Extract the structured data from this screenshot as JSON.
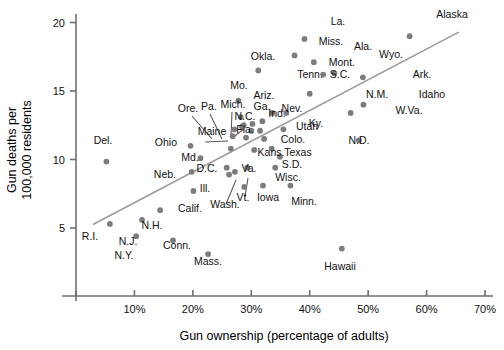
{
  "chart_data": {
    "type": "scatter",
    "title": "",
    "xlabel": "Gun ownership (percentage of adults)",
    "ylabel": "Gun deaths per 100,000 residents",
    "ylabel_line1": "Gun deaths per",
    "ylabel_line2": "100,000 residents",
    "xlim": [
      0,
      70
    ],
    "ylim": [
      0,
      20
    ],
    "xticks": [
      10,
      20,
      30,
      40,
      50,
      60,
      70
    ],
    "xticklabels": [
      "10%",
      "20%",
      "30%",
      "40%",
      "50%",
      "60%",
      "70%"
    ],
    "yticks": [
      5,
      10,
      15,
      20
    ],
    "yticklabels": [
      "5",
      "10",
      "15",
      "20"
    ],
    "grid": false,
    "legend": null,
    "trendline": {
      "x0": 2.9,
      "y0": 5.25,
      "x1": 65.5,
      "y1": 19.3
    },
    "point_color": "#7c7c7c",
    "line_color": "#9a9a9a",
    "points": [
      {
        "label": "Del.",
        "x": 5.2,
        "y": 9.85,
        "lx": 103,
        "ly": 144,
        "anchor": "middle"
      },
      {
        "label": "R.I.",
        "x": 5.8,
        "y": 5.3,
        "lx": 90,
        "ly": 240,
        "anchor": "middle"
      },
      {
        "label": "N.J.",
        "x": 11.3,
        "y": 5.6,
        "lx": 128,
        "ly": 245,
        "anchor": "middle"
      },
      {
        "label": "N.Y.",
        "x": 10.3,
        "y": 4.4,
        "lx": 124,
        "ly": 259,
        "anchor": "middle"
      },
      {
        "label": "N.H.",
        "x": 14.4,
        "y": 6.3,
        "lx": 152,
        "ly": 229,
        "anchor": "middle"
      },
      {
        "label": "Conn.",
        "x": 16.6,
        "y": 4.1,
        "lx": 177,
        "ly": 249,
        "anchor": "middle"
      },
      {
        "label": "Mass.",
        "x": 22.6,
        "y": 3.1,
        "lx": 208,
        "ly": 265,
        "anchor": "middle"
      },
      {
        "label": "Calif.",
        "x": 20.1,
        "y": 7.7,
        "lx": 190,
        "ly": 212,
        "anchor": "middle"
      },
      {
        "label": "Ohio",
        "x": 19.6,
        "y": 11.0,
        "lx": 177,
        "ly": 146,
        "anchor": "end"
      },
      {
        "label": "Md.",
        "x": 21.3,
        "y": 10.1,
        "lx": 190,
        "ly": 161,
        "anchor": "middle"
      },
      {
        "label": "Neb.",
        "x": 19.8,
        "y": 9.1,
        "lx": 176,
        "ly": 178,
        "anchor": "end"
      },
      {
        "label": "Wash.",
        "x": 27.2,
        "y": 9.1,
        "lx": 225,
        "ly": 208,
        "anchor": "middle"
      },
      {
        "label": "Ill.",
        "x": 26.2,
        "y": 8.9,
        "lx": 205,
        "ly": 192,
        "anchor": "middle"
      },
      {
        "label": "D.C.",
        "x": 25.8,
        "y": 9.4,
        "lx": 207,
        "ly": 172,
        "anchor": "middle"
      },
      {
        "label": "Va.",
        "x": 29.3,
        "y": 9.4,
        "lx": 249,
        "ly": 172,
        "anchor": "middle"
      },
      {
        "label": "Vt.",
        "x": 28.8,
        "y": 8.0,
        "lx": 243,
        "ly": 201,
        "anchor": "middle"
      },
      {
        "label": "Iowa",
        "x": 32.0,
        "y": 8.1,
        "lx": 268,
        "ly": 201,
        "anchor": "middle"
      },
      {
        "label": "Minn.",
        "x": 36.7,
        "y": 8.1,
        "lx": 304,
        "ly": 205,
        "anchor": "middle"
      },
      {
        "label": "Wisc.",
        "x": 34.1,
        "y": 9.4,
        "lx": 288,
        "ly": 181,
        "anchor": "middle"
      },
      {
        "label": "S.D.",
        "x": 34.9,
        "y": 10.2,
        "lx": 292,
        "ly": 168,
        "anchor": "middle"
      },
      {
        "label": "Texas",
        "x": 33.5,
        "y": 10.8,
        "lx": 298,
        "ly": 156,
        "anchor": "middle"
      },
      {
        "label": "Kans.",
        "x": 30.5,
        "y": 10.7,
        "lx": 271,
        "ly": 156,
        "anchor": "middle"
      },
      {
        "label": "Colo.",
        "x": 32.2,
        "y": 11.5,
        "lx": 293,
        "ly": 143,
        "anchor": "middle"
      },
      {
        "label": "Utah",
        "x": 31.5,
        "y": 12.1,
        "lx": 307,
        "ly": 130,
        "anchor": "middle"
      },
      {
        "label": "Maine",
        "x": 26.5,
        "y": 10.8,
        "lx": 212,
        "ly": 135,
        "anchor": "middle"
      },
      {
        "label": "Ore.",
        "x": 26.8,
        "y": 11.7,
        "lx": 188,
        "ly": 112,
        "anchor": "middle"
      },
      {
        "label": "Pa.",
        "x": 27.1,
        "y": 12.2,
        "lx": 209,
        "ly": 110,
        "anchor": "middle"
      },
      {
        "label": "Mich.",
        "x": 28.4,
        "y": 12.4,
        "lx": 233,
        "ly": 108,
        "anchor": "middle"
      },
      {
        "label": "N.C.",
        "x": 28.7,
        "y": 12.5,
        "lx": 245,
        "ly": 120,
        "anchor": "middle"
      },
      {
        "label": "Fla.",
        "x": 29.1,
        "y": 11.6,
        "lx": 245,
        "ly": 133,
        "anchor": "middle"
      },
      {
        "label": "Ga.",
        "x": 30.2,
        "y": 12.6,
        "lx": 262,
        "ly": 110,
        "anchor": "middle"
      },
      {
        "label": "Ind.",
        "x": 30.0,
        "y": 12.1,
        "lx": 277,
        "ly": 117,
        "anchor": "middle"
      },
      {
        "label": "Ariz.",
        "x": 28.2,
        "y": 13.1,
        "lx": 264,
        "ly": 99,
        "anchor": "middle"
      },
      {
        "label": "Nev.",
        "x": 31.9,
        "y": 12.8,
        "lx": 292,
        "ly": 112,
        "anchor": "middle"
      },
      {
        "label": "Mo.",
        "x": 27.8,
        "y": 14.3,
        "lx": 239,
        "ly": 89,
        "anchor": "middle"
      },
      {
        "label": "Okla.",
        "x": 31.2,
        "y": 16.5,
        "lx": 263,
        "ly": 60,
        "anchor": "middle"
      },
      {
        "label": "Tenn.",
        "x": 33.6,
        "y": 13.4,
        "lx": 310,
        "ly": 78,
        "anchor": "middle"
      },
      {
        "label": "S.C.",
        "x": 36.0,
        "y": 13.4,
        "lx": 340,
        "ly": 78,
        "anchor": "middle"
      },
      {
        "label": "Ky.",
        "x": 35.5,
        "y": 12.2,
        "lx": 316,
        "ly": 127,
        "anchor": "middle"
      },
      {
        "label": "Miss.",
        "x": 37.4,
        "y": 17.6,
        "lx": 331,
        "ly": 45,
        "anchor": "middle"
      },
      {
        "label": "La.",
        "x": 39.1,
        "y": 18.8,
        "lx": 338,
        "ly": 25,
        "anchor": "middle"
      },
      {
        "label": "Ala.",
        "x": 40.7,
        "y": 17.1,
        "lx": 363,
        "ly": 50,
        "anchor": "middle"
      },
      {
        "label": "Mont.",
        "x": 42.3,
        "y": 16.2,
        "lx": 355,
        "ly": 66,
        "anchor": "end"
      },
      {
        "label": "Wyo.",
        "x": 44.2,
        "y": 16.3,
        "lx": 391,
        "ly": 58,
        "anchor": "middle"
      },
      {
        "label": "N.M.",
        "x": 40.0,
        "y": 14.8,
        "lx": 377,
        "ly": 98,
        "anchor": "middle"
      },
      {
        "label": "N.D.",
        "x": 48.4,
        "y": 11.4,
        "lx": 359,
        "ly": 144,
        "anchor": "middle"
      },
      {
        "label": "W.Va.",
        "x": 47.0,
        "y": 13.4,
        "lx": 409,
        "ly": 114,
        "anchor": "middle"
      },
      {
        "label": "Idaho",
        "x": 49.2,
        "y": 14.0,
        "lx": 432,
        "ly": 98,
        "anchor": "middle"
      },
      {
        "label": "Ark.",
        "x": 49.1,
        "y": 16.0,
        "lx": 422,
        "ly": 78,
        "anchor": "middle"
      },
      {
        "label": "Alaska",
        "x": 57.1,
        "y": 19.0,
        "lx": 452,
        "ly": 18,
        "anchor": "middle"
      },
      {
        "label": "Hawaii",
        "x": 45.5,
        "y": 3.5,
        "lx": 340,
        "ly": 270,
        "anchor": "middle"
      }
    ],
    "leaders": [
      {
        "x1": 192,
        "y1": 116,
        "x2": 212,
        "y2": 139
      },
      {
        "x1": 210,
        "y1": 114,
        "x2": 222,
        "y2": 139
      },
      {
        "x1": 232,
        "y1": 112,
        "x2": 231,
        "y2": 136
      },
      {
        "x1": 232,
        "y1": 138,
        "x2": 244,
        "y2": 129
      },
      {
        "x1": 205,
        "y1": 142,
        "x2": 228,
        "y2": 141
      },
      {
        "x1": 226,
        "y1": 204,
        "x2": 236,
        "y2": 180
      },
      {
        "x1": 245,
        "y1": 197,
        "x2": 248,
        "y2": 178
      }
    ]
  }
}
